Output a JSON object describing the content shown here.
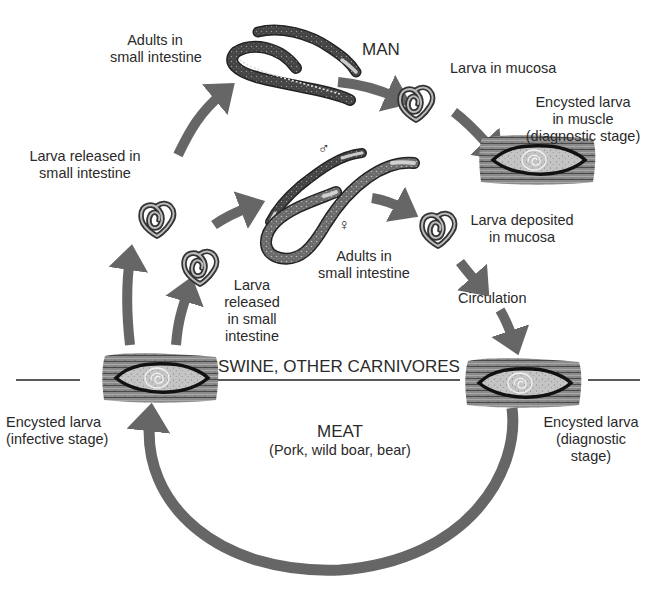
{
  "diagram": {
    "type": "life-cycle",
    "colors": {
      "arrow": "#666666",
      "worm_dark": "#3e3e3e",
      "worm_light": "#bdbdbd",
      "cyst_fill": "#c8c8c8",
      "cyst_outline": "#1a1a1a",
      "text": "#2a2a2a"
    },
    "hosts": {
      "man": "MAN",
      "swine": "SWINE, OTHER CARNIVORES",
      "meat_title": "MEAT",
      "meat_sub": "(Pork, wild boar, bear)"
    },
    "labels": {
      "adults_top": [
        "Adults in",
        "small intestine"
      ],
      "larva_mucosa": "Larva in mucosa",
      "encysted_muscle": [
        "Encysted larva",
        "in muscle",
        "(diagnostic stage)"
      ],
      "larva_released_left": [
        "Larva released in",
        "small intestine"
      ],
      "larva_released_mid": [
        "Larva",
        "released",
        "in small",
        "intestine"
      ],
      "adults_mid": [
        "Adults in",
        "small intestine"
      ],
      "larva_deposited": [
        "Larva deposited",
        "in mucosa"
      ],
      "circulation": "Circulation",
      "encysted_infective": [
        "Encysted larva",
        "(infective stage)"
      ],
      "encysted_diagnostic": [
        "Encysted larva",
        "(diagnostic",
        "stage)"
      ]
    },
    "symbols": {
      "male": "♂",
      "female": "♀"
    },
    "nodes": [
      {
        "id": "adults-man",
        "label": "Adults in small intestine"
      },
      {
        "id": "larva-mucosa",
        "label": "Larva in mucosa"
      },
      {
        "id": "encysted-muscle-man",
        "label": "Encysted larva in muscle (diagnostic stage)"
      },
      {
        "id": "larva-released-1",
        "label": "Larva released in small intestine"
      },
      {
        "id": "larva-released-2",
        "label": "Larva released in small intestine"
      },
      {
        "id": "adults-swine",
        "label": "Adults in small intestine"
      },
      {
        "id": "larva-deposited",
        "label": "Larva deposited in mucosa"
      },
      {
        "id": "circulation",
        "label": "Circulation"
      },
      {
        "id": "encysted-infective",
        "label": "Encysted larva (infective stage)"
      },
      {
        "id": "encysted-diagnostic",
        "label": "Encysted larva (diagnostic stage)"
      }
    ],
    "edges": [
      [
        "encysted-infective",
        "larva-released-1"
      ],
      [
        "larva-released-1",
        "adults-man"
      ],
      [
        "adults-man",
        "larva-mucosa"
      ],
      [
        "larva-mucosa",
        "encysted-muscle-man"
      ],
      [
        "encysted-infective",
        "larva-released-2"
      ],
      [
        "larva-released-2",
        "adults-swine"
      ],
      [
        "adults-swine",
        "larva-deposited"
      ],
      [
        "larva-deposited",
        "circulation"
      ],
      [
        "circulation",
        "encysted-diagnostic"
      ],
      [
        "encysted-diagnostic",
        "encysted-infective"
      ]
    ]
  }
}
